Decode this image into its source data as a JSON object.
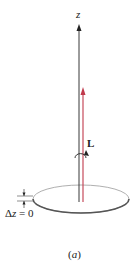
{
  "figure": {
    "axis_label": "z",
    "vector_label": "L",
    "delta_label_prefix": "Δ",
    "delta_label_var": "z",
    "delta_label_suffix": " = 0",
    "caption_open": "(",
    "caption_letter": "a",
    "caption_close": ")"
  },
  "colors": {
    "axis": "#222222",
    "vector": "#c0394b",
    "disk_edge": "#555555"
  }
}
